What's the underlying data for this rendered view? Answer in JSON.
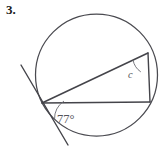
{
  "figure": {
    "problem_number": "3.",
    "caption_color": "#1a1a1a",
    "stroke_color": "#4a4a50",
    "background_color": "#ffffff",
    "circle": {
      "center_x": 96.5,
      "center_y": 75,
      "radius": 61
    },
    "points": {
      "tangent_point": {
        "x": 42,
        "y": 103,
        "label": "tangent-point"
      },
      "upper_right": {
        "x": 148,
        "y": 53,
        "label": "upper-right-vertex"
      },
      "lower_right": {
        "x": 150,
        "y": 102,
        "label": "lower-right-vertex"
      }
    },
    "tangent_line": {
      "x1": 21,
      "y1": 65,
      "x2": 68,
      "y2": 145
    },
    "chords": [
      {
        "name": "chord-diagonal",
        "x1": 42,
        "y1": 103,
        "x2": 148,
        "y2": 53
      },
      {
        "name": "chord-horizontal",
        "x1": 42,
        "y1": 103,
        "x2": 150,
        "y2": 102
      },
      {
        "name": "chord-right-vertical",
        "x1": 148,
        "y1": 53,
        "x2": 150,
        "y2": 102
      }
    ],
    "angles": [
      {
        "name": "angle-77",
        "label": "77°",
        "value": 77,
        "unit": "degrees",
        "label_x": 57,
        "label_y": 123,
        "arc_path": "M 64 101 A 22 22 0 0 0 54.5 119.5"
      },
      {
        "name": "angle-c",
        "label": "c",
        "value": null,
        "unit": "unknown",
        "label_x": 128,
        "label_y": 78,
        "arc_path": "M 133.0 60.0 A 19 19 0 0 0 140.8 71.9"
      }
    ]
  }
}
